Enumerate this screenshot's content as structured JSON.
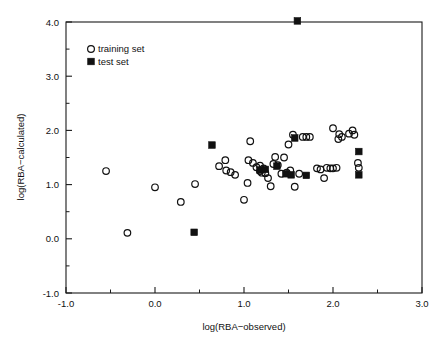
{
  "chart_data": {
    "type": "scatter",
    "title": "",
    "xlabel": "log(RBA−observed)",
    "ylabel": "log(RBA−calculated)",
    "xlim": [
      -1.0,
      3.0
    ],
    "ylim": [
      -1.0,
      4.0
    ],
    "xticks": [
      "-1.0",
      "0.0",
      "1.0",
      "2.0",
      "3.0"
    ],
    "xtick_values": [
      -1.0,
      0.0,
      1.0,
      2.0,
      3.0
    ],
    "yticks": [
      "-1.0",
      "0.0",
      "1.0",
      "2.0",
      "3.0",
      "4.0"
    ],
    "ytick_values": [
      -1.0,
      0.0,
      1.0,
      2.0,
      3.0,
      4.0
    ],
    "xminor_values": [
      -0.5,
      0.5,
      1.5,
      2.5
    ],
    "yminor_values": [
      -0.5,
      0.5,
      1.5,
      2.5,
      3.5
    ],
    "grid": false,
    "legend_position": "upper-left",
    "series": [
      {
        "name": "training set",
        "marker": "open-circle",
        "color": "#111111",
        "points": [
          [
            -0.55,
            1.25
          ],
          [
            -0.31,
            0.11
          ],
          [
            0.0,
            0.95
          ],
          [
            0.29,
            0.68
          ],
          [
            0.45,
            1.01
          ],
          [
            0.72,
            1.34
          ],
          [
            0.79,
            1.45
          ],
          [
            0.8,
            1.26
          ],
          [
            0.85,
            1.23
          ],
          [
            0.9,
            1.18
          ],
          [
            1.0,
            0.72
          ],
          [
            1.04,
            1.03
          ],
          [
            1.05,
            1.45
          ],
          [
            1.07,
            1.8
          ],
          [
            1.1,
            1.4
          ],
          [
            1.14,
            1.32
          ],
          [
            1.18,
            1.25
          ],
          [
            1.18,
            1.35
          ],
          [
            1.2,
            1.22
          ],
          [
            1.22,
            1.3
          ],
          [
            1.24,
            1.21
          ],
          [
            1.27,
            1.12
          ],
          [
            1.3,
            0.97
          ],
          [
            1.33,
            1.38
          ],
          [
            1.35,
            1.51
          ],
          [
            1.38,
            1.36
          ],
          [
            1.42,
            1.2
          ],
          [
            1.45,
            1.5
          ],
          [
            1.48,
            1.22
          ],
          [
            1.5,
            1.74
          ],
          [
            1.52,
            1.26
          ],
          [
            1.55,
            1.92
          ],
          [
            1.57,
            0.96
          ],
          [
            1.62,
            1.2
          ],
          [
            1.66,
            1.88
          ],
          [
            1.7,
            1.88
          ],
          [
            1.74,
            1.88
          ],
          [
            1.82,
            1.3
          ],
          [
            1.86,
            1.28
          ],
          [
            1.9,
            1.12
          ],
          [
            1.93,
            1.31
          ],
          [
            1.97,
            1.3
          ],
          [
            2.0,
            1.3
          ],
          [
            2.0,
            2.04
          ],
          [
            2.04,
            1.31
          ],
          [
            2.06,
            1.84
          ],
          [
            2.07,
            1.93
          ],
          [
            2.1,
            1.88
          ],
          [
            2.18,
            1.94
          ],
          [
            2.22,
            2.0
          ],
          [
            2.24,
            1.92
          ],
          [
            2.28,
            1.4
          ],
          [
            2.29,
            1.31
          ]
        ]
      },
      {
        "name": "test set",
        "marker": "filled-square",
        "color": "#111111",
        "points": [
          [
            0.44,
            0.12
          ],
          [
            0.64,
            1.73
          ],
          [
            1.18,
            1.27
          ],
          [
            1.24,
            1.28
          ],
          [
            1.37,
            1.34
          ],
          [
            1.47,
            1.2
          ],
          [
            1.53,
            1.18
          ],
          [
            1.57,
            1.86
          ],
          [
            1.6,
            4.02
          ],
          [
            1.7,
            1.17
          ],
          [
            2.29,
            1.61
          ],
          [
            2.29,
            1.18
          ]
        ]
      }
    ]
  },
  "legend": {
    "entries": [
      {
        "label": "training set",
        "marker": "open-circle"
      },
      {
        "label": "test set",
        "marker": "filled-square"
      }
    ]
  },
  "colors": {
    "axis": "#1a1a1a",
    "marker": "#111111",
    "background": "#ffffff"
  }
}
